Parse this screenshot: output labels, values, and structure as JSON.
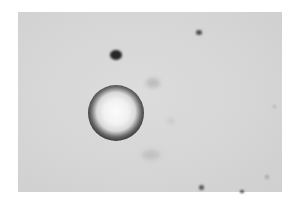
{
  "image": {
    "description": "Grayscale micrograph showing a single ring-shaped bubble/droplet with a bright center on a light gray background, with a few small dark debris particles",
    "background_color": "#d6d6d6",
    "frame": {
      "x": 18,
      "y": 12,
      "width": 264,
      "height": 180
    }
  },
  "objects": {
    "bubble": {
      "cx": 116,
      "cy": 113,
      "outer_radius": 28,
      "ring_color": "#2e2e2e",
      "center_color": "#f8f8f8"
    },
    "specks": [
      {
        "name": "debris-cluster",
        "x": 110,
        "y": 50,
        "w": 12,
        "h": 10,
        "color": "#262626"
      },
      {
        "name": "debris-small-top-right",
        "x": 196,
        "y": 30,
        "w": 6,
        "h": 5,
        "color": "#4a4a4a"
      },
      {
        "name": "debris-bottom",
        "x": 199,
        "y": 185,
        "w": 5,
        "h": 5,
        "color": "#555555"
      },
      {
        "name": "debris-bottom-right",
        "x": 240,
        "y": 190,
        "w": 4,
        "h": 3,
        "color": "#333333"
      },
      {
        "name": "faint-speck-right",
        "x": 265,
        "y": 175,
        "w": 4,
        "h": 4,
        "color": "#a8a8a8"
      },
      {
        "name": "faint-speck-far-right",
        "x": 273,
        "y": 105,
        "w": 3,
        "h": 3,
        "color": "#b0b0b0"
      }
    ],
    "smudges": [
      {
        "name": "smudge-center",
        "x": 146,
        "y": 78,
        "w": 14,
        "h": 10,
        "color": "#bdbdbd"
      },
      {
        "name": "smudge-lower",
        "x": 142,
        "y": 150,
        "w": 18,
        "h": 10,
        "color": "#c2c2c2"
      },
      {
        "name": "smudge-mid-right",
        "x": 168,
        "y": 118,
        "w": 6,
        "h": 6,
        "color": "#c6c6c6"
      }
    ]
  }
}
